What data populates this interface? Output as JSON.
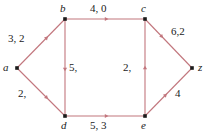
{
  "figure": {
    "type": "flow-network-graph",
    "edge_color": "#c2767d",
    "node_color": "#1b1b1b",
    "label_color": "#1b1b1b",
    "background": "#ffffff"
  },
  "nodes": [
    {
      "id": "a",
      "label": "a",
      "x": 17,
      "y": 68,
      "label_x": 3,
      "label_y": 62
    },
    {
      "id": "b",
      "label": "b",
      "x": 65,
      "y": 19,
      "label_x": 60,
      "label_y": 3
    },
    {
      "id": "c",
      "label": "c",
      "x": 145,
      "y": 19,
      "label_x": 141,
      "label_y": 3
    },
    {
      "id": "d",
      "label": "d",
      "x": 65,
      "y": 116,
      "label_x": 61,
      "label_y": 120
    },
    {
      "id": "e",
      "label": "e",
      "x": 145,
      "y": 116,
      "label_x": 141,
      "label_y": 120
    },
    {
      "id": "z",
      "label": "z",
      "x": 192,
      "y": 68,
      "label_x": 198,
      "label_y": 62
    }
  ],
  "edges": [
    {
      "id": "a-b",
      "from": "a",
      "to": "b",
      "label": "3, 2",
      "label_x": 8,
      "label_y": 33,
      "arrow_t": 0.62
    },
    {
      "id": "a-d",
      "from": "a",
      "to": "d",
      "label": "2,",
      "label_x": 18,
      "label_y": 88,
      "arrow_t": 0.62
    },
    {
      "id": "b-c",
      "from": "b",
      "to": "c",
      "label": "4, 0",
      "label_x": 90,
      "label_y": 3,
      "arrow_t": 0.52
    },
    {
      "id": "b-d",
      "from": "b",
      "to": "d",
      "label": "5,",
      "label_x": 69,
      "label_y": 62,
      "arrow_t": 0.52
    },
    {
      "id": "d-e",
      "from": "d",
      "to": "e",
      "label": "5, 3",
      "label_x": 90,
      "label_y": 120,
      "arrow_t": 0.52
    },
    {
      "id": "e-c",
      "from": "e",
      "to": "c",
      "label": "2,",
      "label_x": 123,
      "label_y": 62,
      "arrow_t": 0.5
    },
    {
      "id": "c-z",
      "from": "c",
      "to": "z",
      "label": "6,2",
      "label_x": 171,
      "label_y": 26,
      "arrow_t": 0.36
    },
    {
      "id": "e-z",
      "from": "e",
      "to": "z",
      "label": "4",
      "label_x": 175,
      "label_y": 88,
      "arrow_t": 0.44
    }
  ]
}
